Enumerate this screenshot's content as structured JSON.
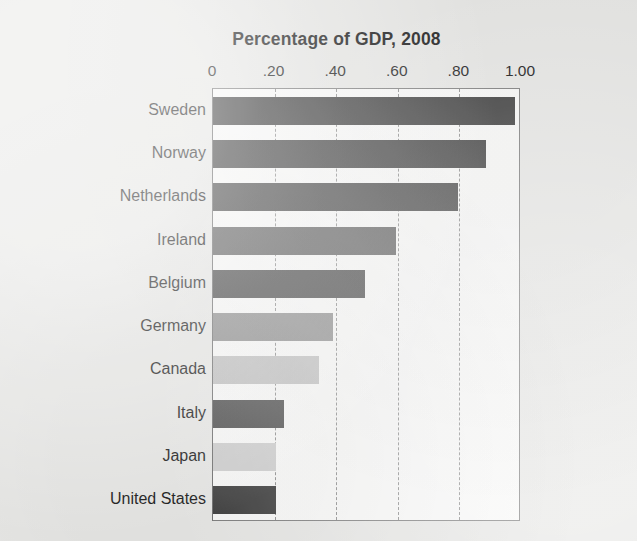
{
  "chart_data": {
    "type": "bar",
    "orientation": "horizontal",
    "title": "Percentage of GDP, 2008",
    "xlabel": "",
    "ylabel": "",
    "xlim": [
      0,
      1.0
    ],
    "xticks": [
      0,
      0.2,
      0.4,
      0.6,
      0.8,
      1.0
    ],
    "xticklabels": [
      "0",
      ".20",
      ".40",
      ".60",
      ".80",
      "1.00"
    ],
    "grid": "vertical-dashed",
    "legend": "none",
    "categories": [
      "Sweden",
      "Norway",
      "Netherlands",
      "Ireland",
      "Belgium",
      "Germany",
      "Canada",
      "Italy",
      "Japan",
      "United States"
    ],
    "values": [
      0.98,
      0.885,
      0.795,
      0.595,
      0.495,
      0.39,
      0.345,
      0.23,
      0.205,
      0.205
    ],
    "bar_colors": [
      "#3e3e3e",
      "#414141",
      "#464646",
      "#5f5f5f",
      "#474747",
      "#8e8e8e",
      "#c2c2c2",
      "#4b4b4b",
      "#cfcfcf",
      "#3c3c3c"
    ]
  },
  "page": {
    "background_color": "#e9e9e7",
    "plot_background_color": "#fbfbfa",
    "gridline_color": "#8d8d8d",
    "axis_color": "#7e7e7e",
    "text_color": "#1b1b1b"
  }
}
